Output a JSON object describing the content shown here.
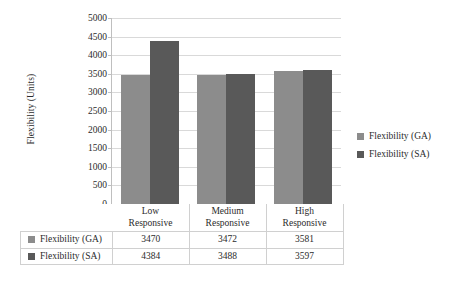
{
  "chart_data": {
    "type": "bar",
    "title": "",
    "xlabel": "",
    "ylabel": "Flexibility (Units)",
    "ylim": [
      0,
      5000
    ],
    "ytick_step": 500,
    "yticks": [
      "5000",
      "4500",
      "4000",
      "3500",
      "3000",
      "2500",
      "2000",
      "1500",
      "1000",
      "500",
      "0"
    ],
    "ytick_values": [
      5000,
      4500,
      4000,
      3500,
      3000,
      2500,
      2000,
      1500,
      1000,
      500,
      0
    ],
    "grid": true,
    "legend_position": "right",
    "categories": [
      "Low Responsive",
      "Medium Responsive",
      "High Responsive"
    ],
    "category_lines": [
      [
        "Low",
        "Responsive"
      ],
      [
        "Medium",
        "Responsive"
      ],
      [
        "High",
        "Responsive"
      ]
    ],
    "series": [
      {
        "name": "Flexibility (GA)",
        "color": "#8c8c8c",
        "values": [
          3470,
          3472,
          3581
        ]
      },
      {
        "name": "Flexibility (SA)",
        "color": "#595959",
        "values": [
          4384,
          3488,
          3597
        ]
      }
    ]
  },
  "legend": {
    "items": [
      {
        "label": "Flexibility (GA)",
        "color": "#8c8c8c"
      },
      {
        "label": "Flexibility (SA)",
        "color": "#595959"
      }
    ]
  },
  "data_table": {
    "corner": "",
    "column_headers": [
      {
        "line1": "Low",
        "line2": "Responsive"
      },
      {
        "line1": "Medium",
        "line2": "Responsive"
      },
      {
        "line1": "High",
        "line2": "Responsive"
      }
    ],
    "rows": [
      {
        "series": "Flexibility (GA)",
        "swatch": "ga",
        "values": [
          "3470",
          "3472",
          "3581"
        ]
      },
      {
        "series": "Flexibility (SA)",
        "swatch": "sa",
        "values": [
          "4384",
          "3488",
          "3597"
        ]
      }
    ]
  }
}
